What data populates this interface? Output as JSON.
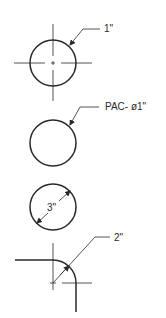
{
  "drawing": {
    "title": "Circle and arc dimensioning examples",
    "examples": [
      {
        "id": "radius-with-centerlines",
        "label": "1\""
      },
      {
        "id": "diameter-callout",
        "label": "PAC- ø1\""
      },
      {
        "id": "diameter-inside",
        "label": "3\""
      },
      {
        "id": "fillet-radius",
        "label": "2\""
      }
    ],
    "line_color": "#2a2a2a"
  }
}
